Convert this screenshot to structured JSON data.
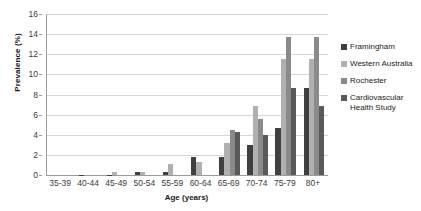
{
  "chart_data": {
    "type": "bar",
    "title": "",
    "xlabel": "Age (years)",
    "ylabel": "Prevalence (%)",
    "categories": [
      "35-39",
      "40-44",
      "45-49",
      "50-54",
      "55-59",
      "60-64",
      "65-69",
      "70-74",
      "75-79",
      "80+"
    ],
    "series": [
      {
        "name": "Framingham",
        "color": "#3f3f3f",
        "values": [
          0,
          0.05,
          0.05,
          0.25,
          0.3,
          1.75,
          1.8,
          3.0,
          4.7,
          8.6
        ]
      },
      {
        "name": "Western Australia",
        "color": "#b0b0b0",
        "values": [
          0,
          0,
          0.3,
          0.25,
          1.1,
          1.3,
          3.2,
          6.9,
          11.5,
          11.5
        ]
      },
      {
        "name": "Rochester",
        "color": "#8a8a8a",
        "values": [
          0,
          0,
          0,
          0,
          0,
          0,
          4.5,
          5.6,
          13.7,
          13.7
        ]
      },
      {
        "name": "Cardiovascular Health Study",
        "color": "#595959",
        "values": [
          0,
          0,
          0,
          0,
          0,
          0,
          4.3,
          4.0,
          8.6,
          6.9
        ]
      }
    ],
    "ylim": [
      0,
      16
    ],
    "ytick_step": 2,
    "yticks": [
      0,
      2,
      4,
      6,
      8,
      10,
      12,
      14,
      16
    ],
    "grid": true,
    "legend_position": "right",
    "axis_color": "#9a9a9a",
    "gridline_color": "#d6d6d6"
  }
}
